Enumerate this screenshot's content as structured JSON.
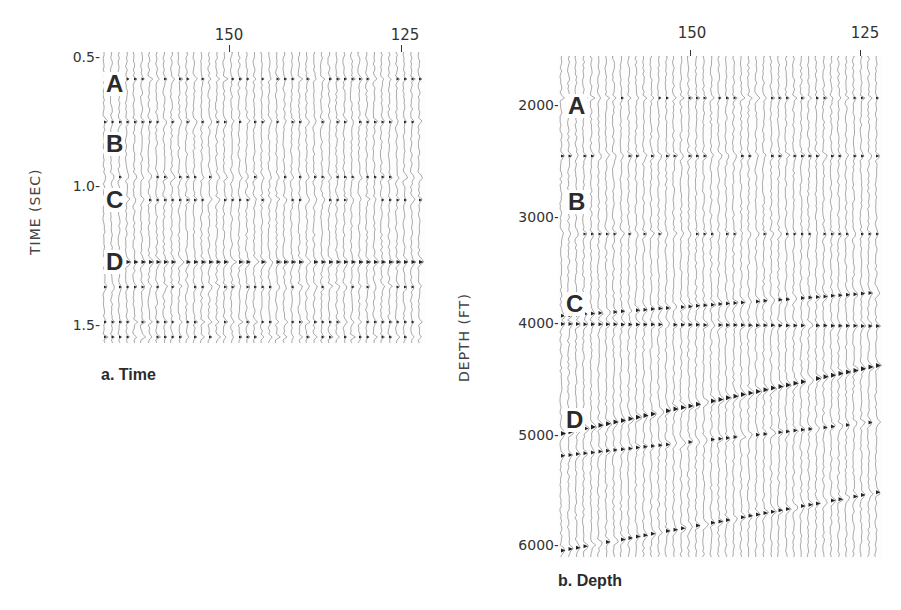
{
  "figure": {
    "panels": [
      {
        "id": "a",
        "caption": "a. Time",
        "y_axis_title": "TIME (SEC)",
        "x_ticks": [
          {
            "label": "150"
          },
          {
            "label": "125"
          }
        ],
        "y_ticks": [
          {
            "label": "0.5-"
          },
          {
            "label": "1.0-"
          },
          {
            "label": "1.5-"
          }
        ],
        "horizons": [
          {
            "label": "A"
          },
          {
            "label": "B"
          },
          {
            "label": "C"
          },
          {
            "label": "D"
          }
        ]
      },
      {
        "id": "b",
        "caption": "b. Depth",
        "y_axis_title": "DEPTH (FT)",
        "x_ticks": [
          {
            "label": "150"
          },
          {
            "label": "125"
          }
        ],
        "y_ticks": [
          {
            "label": "2000-"
          },
          {
            "label": "3000-"
          },
          {
            "label": "4000-"
          },
          {
            "label": "5000-"
          },
          {
            "label": "6000-"
          }
        ],
        "horizons": [
          {
            "label": "A"
          },
          {
            "label": "B"
          },
          {
            "label": "C"
          },
          {
            "label": "D"
          }
        ]
      }
    ]
  }
}
